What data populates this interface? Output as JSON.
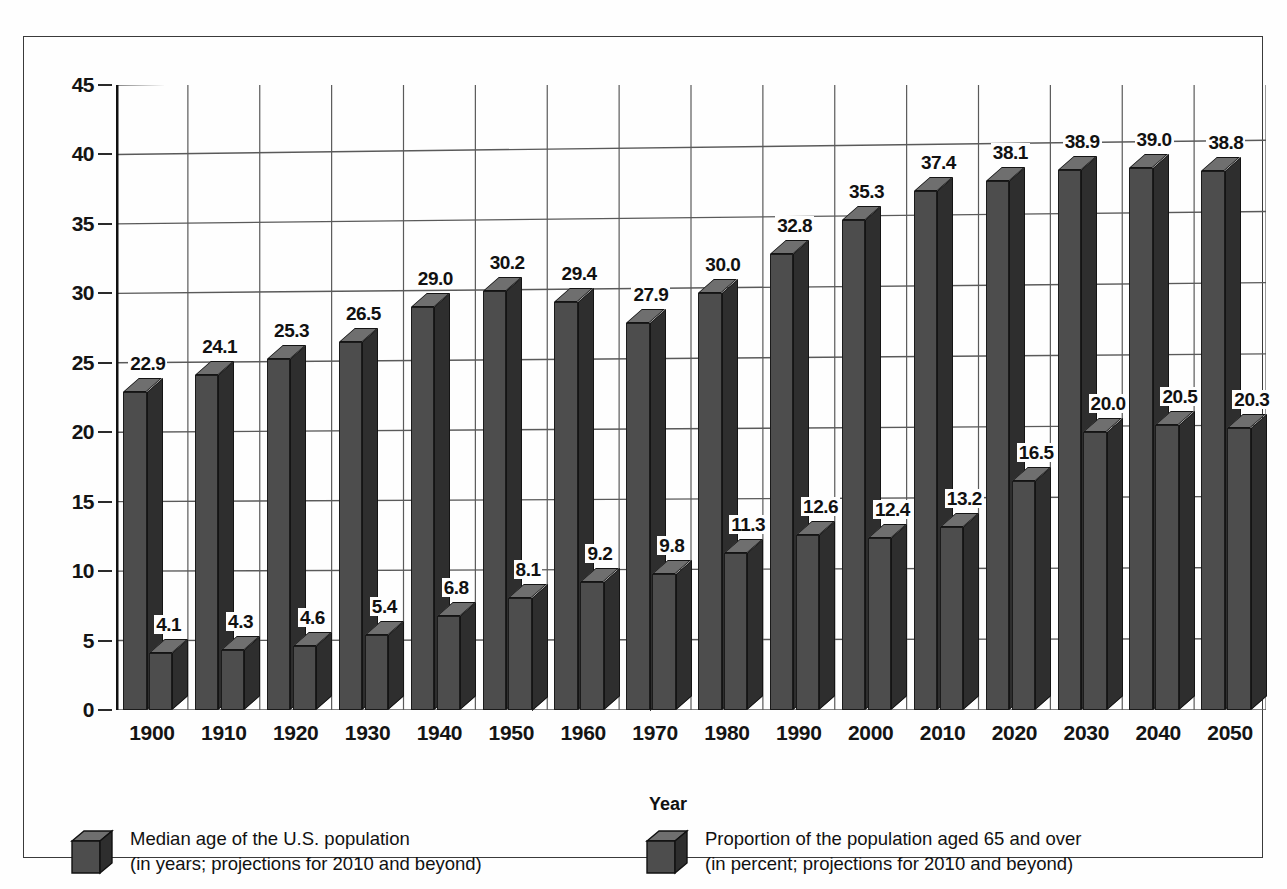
{
  "chart_data": {
    "type": "bar",
    "title": "",
    "subtitle": "",
    "xlabel": "Year",
    "ylabel": "",
    "ylim": [
      0,
      45
    ],
    "yticks": [
      0,
      5,
      10,
      15,
      20,
      25,
      30,
      35,
      40,
      45
    ],
    "grid": true,
    "legend_position": "bottom",
    "categories": [
      "1900",
      "1910",
      "1920",
      "1930",
      "1940",
      "1950",
      "1960",
      "1970",
      "1980",
      "1990",
      "2000",
      "2010",
      "2020",
      "2030",
      "2040",
      "2050"
    ],
    "series": [
      {
        "name": "Median age of the U.S. population",
        "note": "(in years; projections for 2010 and beyond)",
        "unit": "years",
        "values": [
          22.9,
          24.1,
          25.3,
          26.5,
          29.0,
          30.2,
          29.4,
          27.9,
          30.0,
          32.8,
          35.3,
          37.4,
          38.1,
          38.9,
          39.0,
          38.8
        ]
      },
      {
        "name": "Proportion of the population aged 65 and over",
        "note": "(in percent; projections for 2010 and beyond)",
        "unit": "percent",
        "values": [
          4.1,
          4.3,
          4.6,
          5.4,
          6.8,
          8.1,
          9.2,
          9.8,
          11.3,
          12.6,
          12.4,
          13.2,
          16.5,
          20.0,
          20.5,
          20.3
        ]
      }
    ],
    "colors": {
      "bar_front": "#4d4d4d",
      "bar_side": "#2e2e2e",
      "bar_top": "#6f6f6f",
      "grid": "#5a5a5a",
      "text": "#111111",
      "background": "#fefefe"
    }
  },
  "axis": {
    "x_title": "Year"
  },
  "legend": {
    "items": [
      {
        "line1": "Median age of the U.S. population",
        "line2": "(in years; projections for 2010 and beyond)"
      },
      {
        "line1": "Proportion of the population aged 65 and over",
        "line2": "(in percent; projections for 2010 and beyond)"
      }
    ]
  }
}
